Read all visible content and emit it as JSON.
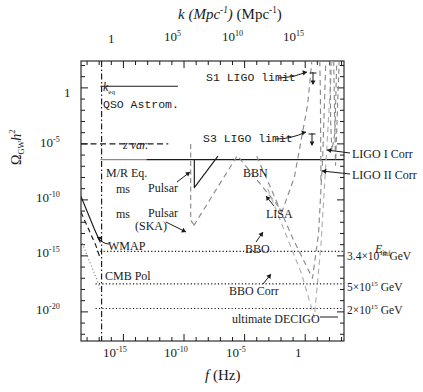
{
  "figure": {
    "title_top_axis": "k (Mpc⁻¹)",
    "title_bottom_axis": "f (Hz)",
    "ylabel": "Ω_GW h²",
    "background": "#ffffff",
    "ink": "#1a1a1a",
    "grey": "#9a9a9a"
  },
  "axes": {
    "x_label_html": "f (Hz)",
    "y_label_html": "Ω<sub>GW</sub>h<sup>2</sup>",
    "top_label_html": "k (Mpc<sup>-1</sup>)",
    "x_ticks": [
      "10<sup>-15</sup>",
      "10<sup>-10</sup>",
      "10<sup>-5</sup>",
      "1"
    ],
    "x_tick_exponents": [
      -15,
      -10,
      -5,
      0
    ],
    "y_ticks": [
      "1",
      "10<sup>-5</sup>",
      "10<sup>-10</sup>",
      "10<sup>-15</sup>",
      "10<sup>-20</sup>"
    ],
    "y_tick_exponents": [
      0,
      -5,
      -10,
      -15,
      -20
    ],
    "top_ticks": [
      "1",
      "10<sup>5</sup>",
      "10<sup>10</sup>",
      "10<sup>15</sup>"
    ],
    "top_tick_exponents": [
      0,
      5,
      10,
      15
    ],
    "xlim": [
      -18.5,
      3.2
    ],
    "ylim": [
      -22.6,
      2.4
    ]
  },
  "annotations": {
    "k_eq": "k",
    "k_eq_sub": "eq",
    "qso_astrom": "QSO Astrom.",
    "s1_ligo": "S1 LIGO limit",
    "s3_ligo": "S3 LIGO limit",
    "z_var": "z var.",
    "mr_eq": "M/R Eq.",
    "bbn": "BBN",
    "ms": "ms",
    "pulsar": "Pulsar",
    "ms2": "ms",
    "pulsar_ska": "Pulsar",
    "ska": "(SKA)",
    "wmap": "WMAP",
    "cmb_pol": "CMB Pol",
    "lisa": "LISA",
    "bbo": "BBO",
    "bbo_corr": "BBO Corr",
    "ultimate_decigo": "ultimate DECIGO",
    "ligo_i_corr": "LIGO I Corr",
    "ligo_ii_corr": "LIGO II Corr",
    "e_inf": "E",
    "e_inf_sub": "inf",
    "einf_1": "3.4×10",
    "einf_1_exp": "16",
    "einf_1_unit": " GeV",
    "einf_2": "5×10",
    "einf_2_exp": "15",
    "einf_2_unit": " GeV",
    "einf_3": "2×10",
    "einf_3_exp": "15",
    "einf_3_unit": " GeV"
  },
  "chart_data": {
    "type": "line",
    "xlabel": "f (Hz)",
    "ylabel": "Omega_GW h^2",
    "xlabel_secondary": "k (Mpc^-1)",
    "x_is_log10": true,
    "y_is_log10": true,
    "xlim": [
      -18.5,
      3.2
    ],
    "ylim": [
      -22.6,
      2.4
    ],
    "grid": false,
    "legend": "none (in-plot text annotations)",
    "series": [
      {
        "name": "k_eq",
        "style": "dash-dot vertical",
        "color": "#1a1a1a",
        "note": "vertical marker line at f ~ 10^-16.8 Hz",
        "points": [
          [
            -16.8,
            2.4
          ],
          [
            -16.8,
            -22.6
          ]
        ]
      },
      {
        "name": "QSO Astrom.",
        "style": "solid horizontal",
        "color": "#1a1a1a",
        "points": [
          [
            -16.9,
            0.15
          ],
          [
            -10.5,
            0.15
          ]
        ]
      },
      {
        "name": "z var.",
        "style": "dashed horizontal",
        "color": "#1a1a1a",
        "points": [
          [
            -18.5,
            -5.0
          ],
          [
            -11.3,
            -5.0
          ]
        ]
      },
      {
        "name": "M/R Eq.",
        "style": "solid horizontal",
        "color": "#8a8a8a",
        "points": [
          [
            -16.9,
            -6.4
          ],
          [
            -13.1,
            -6.4
          ]
        ]
      },
      {
        "name": "BBN",
        "style": "solid horizontal",
        "color": "#1a1a1a",
        "points": [
          [
            -13.1,
            -6.4
          ],
          [
            3.2,
            -6.4
          ]
        ]
      },
      {
        "name": "ms Pulsar",
        "style": "solid V-shape",
        "color": "#1a1a1a",
        "points": [
          [
            -9.15,
            -6.4
          ],
          [
            -9.15,
            -8.9
          ],
          [
            -7.2,
            -6.1
          ]
        ]
      },
      {
        "name": "ms Pulsar (SKA)",
        "style": "dashed vertical/corner",
        "color": "#8a8a8a",
        "points": [
          [
            -9.45,
            -5.0
          ],
          [
            -9.45,
            -11.8
          ],
          [
            -9.2,
            -12.2
          ]
        ]
      },
      {
        "name": "WMAP",
        "style": "solid falling",
        "color": "#1a1a1a",
        "points": [
          [
            -18.5,
            -9.7
          ],
          [
            -17.4,
            -12.6
          ],
          [
            -16.9,
            -13.8
          ]
        ]
      },
      {
        "name": "CMB Pol",
        "style": "dashed falling",
        "color": "#1a1a1a",
        "points": [
          [
            -18.5,
            -11.1
          ],
          [
            -17.3,
            -14.0
          ],
          [
            -16.95,
            -15.1
          ]
        ]
      },
      {
        "name": "CMB Pol dotted lower",
        "style": "dotted falling",
        "color": "#8a8a8a",
        "points": [
          [
            -18.5,
            -13.6
          ],
          [
            -17.2,
            -17.1
          ],
          [
            -16.9,
            -18.0
          ]
        ]
      },
      {
        "name": "LISA",
        "style": "dashed V",
        "color": "#8a8a8a",
        "points": [
          [
            -9.2,
            -12.3
          ],
          [
            -5.6,
            -6.05
          ],
          [
            -1.9,
            -11.0
          ],
          [
            -0.9,
            -8.0
          ],
          [
            0.2,
            -1.5
          ],
          [
            0.55,
            2.4
          ]
        ]
      },
      {
        "name": "S1 LIGO limit",
        "style": "dashed rising",
        "color": "#8a8a8a",
        "points": [
          [
            1.2,
            2.4
          ],
          [
            1.25,
            -0.3
          ],
          [
            1.3,
            -8.5
          ]
        ]
      },
      {
        "name": "BBO",
        "style": "dashed V low",
        "color": "#8a8a8a",
        "points": [
          [
            -4.0,
            -6.1
          ],
          [
            -1.0,
            -13.5
          ],
          [
            0.6,
            -17.0
          ],
          [
            1.1,
            -13.0
          ],
          [
            1.45,
            -6.0
          ],
          [
            1.7,
            2.4
          ]
        ]
      },
      {
        "name": "BBO Corr",
        "style": "dashed V lower",
        "color": "#b0b0b0",
        "points": [
          [
            -3.1,
            -9.0
          ],
          [
            -0.3,
            -16.6
          ],
          [
            0.75,
            -20.5
          ],
          [
            1.3,
            -14.0
          ],
          [
            1.8,
            -5.0
          ],
          [
            2.2,
            2.4
          ]
        ]
      },
      {
        "name": "LIGO I Corr",
        "style": "dashed notch near 10^2 Hz",
        "color": "#8a8a8a",
        "points": [
          [
            2.05,
            2.4
          ],
          [
            2.1,
            -3.0
          ],
          [
            2.2,
            -5.6
          ],
          [
            2.45,
            -4.0
          ],
          [
            2.6,
            2.4
          ]
        ]
      },
      {
        "name": "LIGO II Corr",
        "style": "dashed notch",
        "color": "#8a8a8a",
        "points": [
          [
            2.35,
            2.4
          ],
          [
            2.5,
            -6.9
          ],
          [
            2.8,
            2.4
          ]
        ]
      },
      {
        "name": "E_inf = 3.4e16 GeV",
        "style": "dotted horizontal",
        "color": "#1a1a1a",
        "points": [
          [
            -17.2,
            -14.6
          ],
          [
            3.2,
            -14.6
          ]
        ]
      },
      {
        "name": "E_inf = 5e15 GeV",
        "style": "dotted horizontal",
        "color": "#1a1a1a",
        "points": [
          [
            -17.3,
            -17.5
          ],
          [
            3.2,
            -17.5
          ]
        ]
      },
      {
        "name": "E_inf = 2e15 GeV",
        "style": "dotted horizontal",
        "color": "#1a1a1a",
        "points": [
          [
            -17.3,
            -19.7
          ],
          [
            3.2,
            -19.7
          ]
        ]
      }
    ]
  }
}
